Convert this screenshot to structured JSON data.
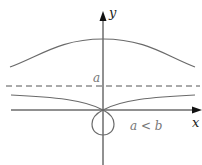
{
  "diagram": {
    "labels": {
      "y_axis": "y",
      "x_axis": "x",
      "asymptote": "a",
      "condition": "a < b"
    },
    "colors": {
      "curve": "#6a6a6a",
      "axis": "#222222",
      "asymptote": "#555555",
      "label": "#777777"
    }
  }
}
